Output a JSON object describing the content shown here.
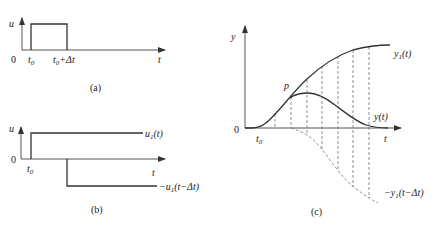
{
  "panel_a": {
    "caption": "(a)",
    "y_axis_label": "u",
    "x_axis_label": "t",
    "origin_label": "0",
    "tick_t0": "t",
    "tick_t0_sub": "0",
    "tick_t0dt_pre": "t",
    "tick_t0dt_sub": "0",
    "tick_t0dt_post": "+Δt"
  },
  "panel_b": {
    "caption": "(b)",
    "y_axis_label": "u",
    "x_axis_label": "t",
    "origin_label": "0",
    "tick_t0": "t",
    "tick_t0_sub": "0",
    "upper_label_pre": "u",
    "upper_label_sub": "1",
    "upper_label_post": "(t)",
    "lower_label_pre": "−u",
    "lower_label_sub": "1",
    "lower_label_post": "(t−Δt)"
  },
  "panel_c": {
    "caption": "(c)",
    "y_axis_label": "y",
    "x_axis_label": "t",
    "origin_label": "0",
    "tick_t0": "t",
    "tick_t0_sub": "0",
    "point_label": "p",
    "y1_label_pre": "y",
    "y1_label_sub": "1",
    "y1_label_post": "(t)",
    "y_label": "y(t)",
    "neg_label_pre": "−y",
    "neg_label_sub": "1",
    "neg_label_post": "(t−Δt)"
  }
}
